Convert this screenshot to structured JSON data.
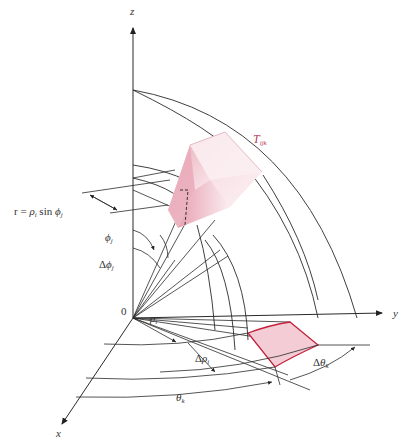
{
  "diagram": {
    "type": "spherical-coordinates-volume-element",
    "colors": {
      "line": "#2a2a2a",
      "element_fill": "#f2c9d2",
      "element_edge": "#c0223a",
      "label_red": "#b83a52",
      "label": "#333333"
    },
    "axes": {
      "z": "z",
      "y": "y",
      "x": "x",
      "origin": "0"
    },
    "labels": {
      "element": {
        "main": "T",
        "sub": "ijk"
      },
      "r_eq": {
        "lhs": "r = ",
        "rho": "ρ",
        "rho_sub": "i",
        "sin": " sin ",
        "phi": "ϕ",
        "phi_sub": "j"
      },
      "phi": {
        "main": "ϕ",
        "sub": "j"
      },
      "dphi": {
        "delta": "Δ",
        "main": "ϕ",
        "sub": "j"
      },
      "rho": {
        "main": "ρ",
        "sub": "i"
      },
      "drho": {
        "delta": "Δ",
        "main": "ρ",
        "sub": "i"
      },
      "theta": {
        "main": "θ",
        "sub": "k"
      },
      "dtheta": {
        "delta": "Δ",
        "main": "θ",
        "sub": "k"
      }
    }
  }
}
